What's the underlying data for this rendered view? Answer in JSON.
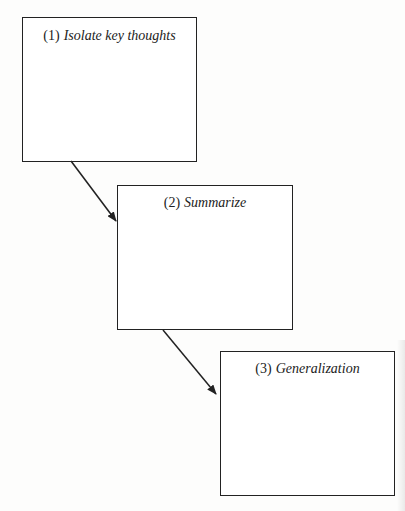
{
  "diagram": {
    "type": "flow",
    "steps": [
      {
        "number": "(1)",
        "label": "Isolate key thoughts"
      },
      {
        "number": "(2)",
        "label": "Summarize"
      },
      {
        "number": "(3)",
        "label": "Generalization"
      }
    ],
    "edges": [
      {
        "from": "(1)",
        "to": "(2)"
      },
      {
        "from": "(2)",
        "to": "(3)"
      }
    ],
    "colors": {
      "stroke": "#222222",
      "background": "#fdfdfc"
    }
  }
}
